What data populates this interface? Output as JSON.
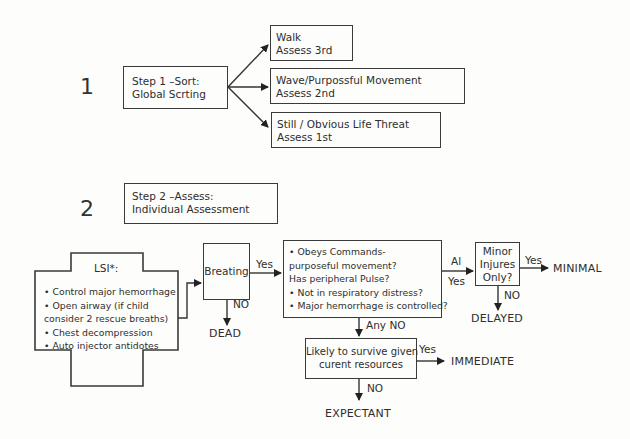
{
  "step1": {
    "number": "1",
    "box_line1": "Step 1 –Sort:",
    "box_line2": "Global Scrting",
    "options": [
      {
        "line1": "Walk",
        "line2": "Assess 3rd"
      },
      {
        "line1": "Wave/Purpossful Movement",
        "line2": "Assess 2nd"
      },
      {
        "line1": "Still / Obvious Life Threat",
        "line2": "Assess 1st"
      }
    ]
  },
  "step2": {
    "number": "2",
    "box_line1": "Step 2 –Assess:",
    "box_line2": "Individual Assessment"
  },
  "lsi": {
    "title": "LSI*:",
    "items": [
      "Control major hemorrhage",
      "Open airway (if child",
      "consider 2 rescue breaths)",
      "Chest decompression",
      "Auto injector antidotes"
    ]
  },
  "breathing": {
    "label": "Breating",
    "yes_label": "Yes",
    "no_label": "NO",
    "no_outcome": "DEAD"
  },
  "assessment": {
    "items": [
      "Obeys Commands-",
      "purposeful movement?",
      "Has peripheral Pulse?",
      "Not in respiratory distress?",
      "Major hemorrhage is controlled?"
    ],
    "all_yes_label_line1": "Al",
    "all_yes_label_line2": "Yes",
    "any_no_label": "Any NO"
  },
  "minor": {
    "line1": "Minor",
    "line2": "Injures",
    "line3": "Only?",
    "yes_label": "Yes",
    "yes_outcome": "MINIMAL",
    "no_label": "NO",
    "no_outcome": "DELAYED"
  },
  "survive": {
    "line1": "Likely to survive given",
    "line2": "curent resources",
    "yes_label": "Yes",
    "yes_outcome": "IMMEDIATE",
    "no_label": "NO",
    "no_outcome": "EXPECTANT"
  }
}
